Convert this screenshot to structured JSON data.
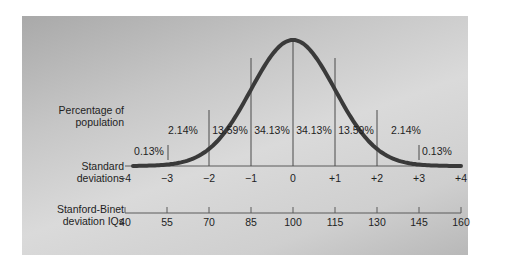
{
  "chart_data": {
    "type": "area",
    "title": "",
    "row_labels": {
      "percentage": "Percentage of population",
      "sd": "Standard deviations",
      "iq": "Stanford-Binet deviation IQs"
    },
    "sd_ticks": [
      "−4",
      "−3",
      "−2",
      "−1",
      "0",
      "+1",
      "+2",
      "+3",
      "+4"
    ],
    "iq_ticks": [
      "40",
      "55",
      "70",
      "85",
      "100",
      "115",
      "130",
      "145",
      "160"
    ],
    "bands": [
      {
        "range": [
          -4,
          -3
        ],
        "percent": "0.13%"
      },
      {
        "range": [
          -3,
          -2
        ],
        "percent": "2.14%"
      },
      {
        "range": [
          -2,
          -1
        ],
        "percent": "13.59%"
      },
      {
        "range": [
          -1,
          0
        ],
        "percent": "34.13%"
      },
      {
        "range": [
          0,
          1
        ],
        "percent": "34.13%"
      },
      {
        "range": [
          1,
          2
        ],
        "percent": "13.59%"
      },
      {
        "range": [
          2,
          3
        ],
        "percent": "2.14%"
      },
      {
        "range": [
          3,
          4
        ],
        "percent": "0.13%"
      }
    ],
    "xlim": [
      -4,
      4
    ],
    "mean_iq": 100,
    "sd_iq": 15
  },
  "labels": {
    "pct_line1": "Percentage of",
    "pct_line2": "population",
    "sd_line1": "Standard",
    "sd_line2": "deviations",
    "iq_line1": "Stanford-Binet",
    "iq_line2": "deviation IQs"
  },
  "colors": {
    "curve": "#3a3a3a",
    "lines": "#4a4a4a",
    "text": "#1e1e1e"
  }
}
